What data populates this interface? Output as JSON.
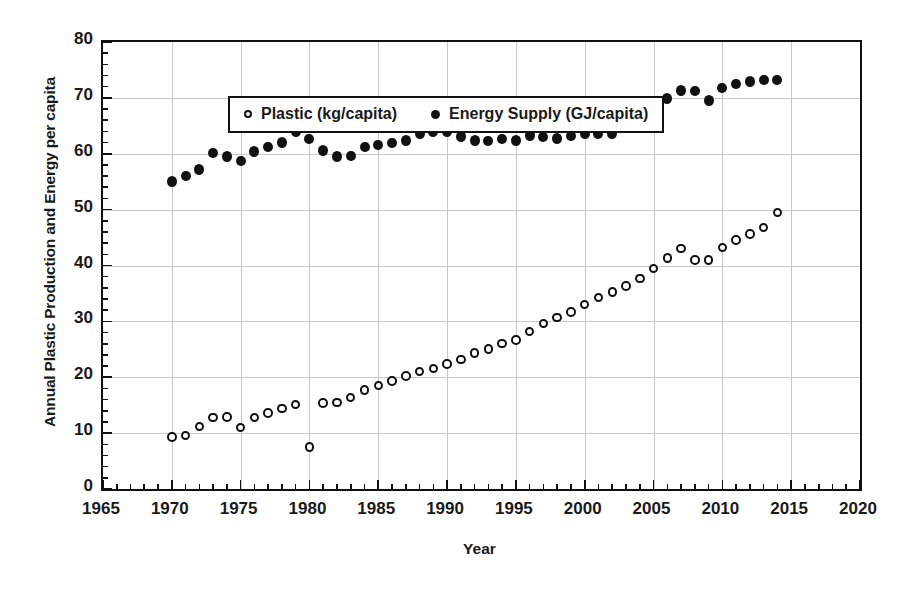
{
  "chart_data": {
    "type": "scatter",
    "title": "",
    "xlabel": "Year",
    "ylabel": "Annual Plastic Production and Energy per capita",
    "xlim": [
      1965,
      2020
    ],
    "ylim": [
      0,
      80
    ],
    "xticks": [
      1965,
      1970,
      1975,
      1980,
      1985,
      1990,
      1995,
      2000,
      2005,
      2010,
      2015,
      2020
    ],
    "yticks": [
      0,
      10,
      20,
      30,
      40,
      50,
      60,
      70,
      80
    ],
    "x_minor_tick_step": 1,
    "y_minor_tick_step": 2,
    "grid": "both",
    "legend_position": "top-left-inside",
    "x": [
      1970,
      1971,
      1972,
      1973,
      1974,
      1975,
      1976,
      1977,
      1978,
      1979,
      1980,
      1981,
      1982,
      1983,
      1984,
      1985,
      1986,
      1987,
      1988,
      1989,
      1990,
      1991,
      1992,
      1993,
      1994,
      1995,
      1996,
      1997,
      1998,
      1999,
      2000,
      2001,
      2002,
      2003,
      2004,
      2005,
      2006,
      2007,
      2008,
      2009,
      2010,
      2011,
      2012,
      2013,
      2014
    ],
    "series": [
      {
        "name": "Plastic (kg/capita)",
        "unit": "kg/capita",
        "marker": "open-circle",
        "color": "#111111",
        "values": [
          9.3,
          9.6,
          11.2,
          12.8,
          12.9,
          11.0,
          12.8,
          13.6,
          14.4,
          15.1,
          7.5,
          15.4,
          15.5,
          16.4,
          17.7,
          18.5,
          19.3,
          20.2,
          21.0,
          21.6,
          22.4,
          23.2,
          24.3,
          25.1,
          26.0,
          26.7,
          28.2,
          29.6,
          30.7,
          31.7,
          33.0,
          34.3,
          35.3,
          36.3,
          37.7,
          39.5,
          41.3,
          43.0,
          41.0,
          41.0,
          43.2,
          44.6,
          45.6,
          46.8,
          49.5
        ]
      },
      {
        "name": "Energy Supply (GJ/capita)",
        "unit": "GJ/capita",
        "marker": "filled-circle",
        "color": "#111111",
        "values": [
          55.0,
          56.0,
          57.2,
          60.1,
          59.5,
          58.7,
          60.4,
          61.2,
          62.0,
          64.0,
          62.6,
          60.6,
          59.5,
          59.6,
          61.2,
          61.6,
          61.9,
          62.4,
          63.6,
          64.0,
          64.0,
          63.1,
          62.4,
          62.3,
          62.6,
          62.4,
          63.3,
          63.0,
          62.7,
          63.2,
          63.6,
          63.5,
          63.6,
          64.8,
          66.7,
          68.9,
          69.9,
          71.3,
          71.2,
          69.5,
          71.8,
          72.5,
          72.9,
          73.2,
          73.2
        ]
      }
    ]
  }
}
